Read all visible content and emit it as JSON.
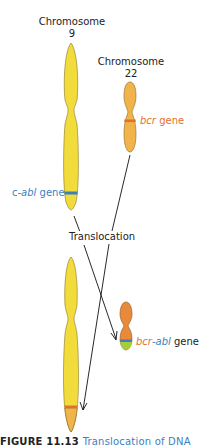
{
  "diagram": {
    "chromosome9": {
      "label_line1": "Chromosome",
      "label_line2": "9",
      "gene_label_prefix": "c-",
      "gene_label_italic": "abl",
      "gene_label_suffix": " gene"
    },
    "chromosome22": {
      "label_line1": "Chromosome",
      "label_line2": "22",
      "gene_label_italic": "bcr",
      "gene_label_suffix": " gene"
    },
    "process_label": "Translocation",
    "fusion": {
      "part1_italic": "bcr",
      "dash": "-",
      "part2_italic": "abl",
      "suffix": " gene"
    },
    "caption": {
      "figure_number": "FIGURE 11.13",
      "title": "Translocation of DNA"
    },
    "colors": {
      "chr9_fill": "#f2dc3c",
      "chr22_fill": "#f0b44a",
      "fusion_fill": "#e98a3a",
      "abl_band": "#3a7fc0",
      "bcr_band": "#e5702a",
      "green_band": "#a6cc3a",
      "outline": "#8a7420",
      "abl_text": "#3a7fc0",
      "bcr_text": "#e5702a"
    }
  }
}
